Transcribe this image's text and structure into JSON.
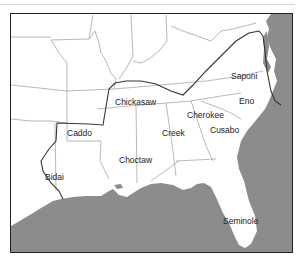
{
  "map": {
    "title": "",
    "colors": {
      "water": "#8c8c8c",
      "land": "#ffffff",
      "state_border": "#9a9a9a",
      "range_line": "#333333",
      "frame": "#222222"
    },
    "tribes": [
      {
        "name": "Saponi",
        "x": 232,
        "y": 77
      },
      {
        "name": "Eno",
        "x": 241,
        "y": 102
      },
      {
        "name": "Cherokee",
        "x": 187,
        "y": 115
      },
      {
        "name": "Chickasaw",
        "x": 115,
        "y": 102
      },
      {
        "name": "Caddo",
        "x": 67,
        "y": 131
      },
      {
        "name": "Creek",
        "x": 162,
        "y": 133
      },
      {
        "name": "Cusabo",
        "x": 210,
        "y": 130
      },
      {
        "name": "Choctaw",
        "x": 120,
        "y": 160
      },
      {
        "name": "Bidai",
        "x": 45,
        "y": 177
      },
      {
        "name": "Seminole",
        "x": 223,
        "y": 221
      }
    ]
  }
}
